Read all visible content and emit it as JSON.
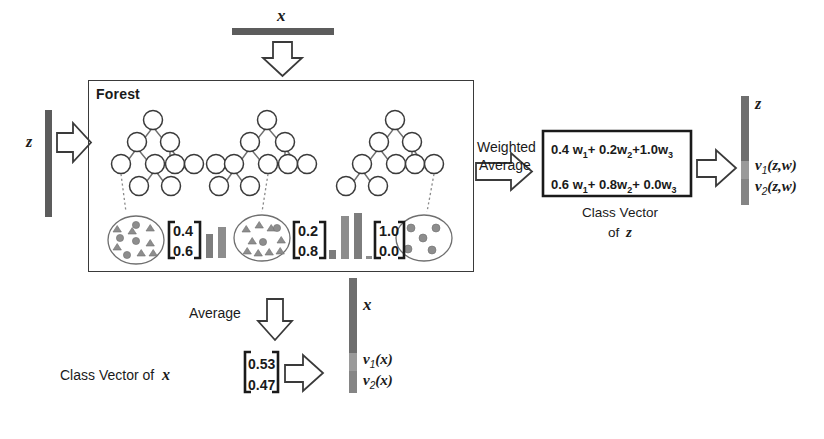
{
  "figure": {
    "forest_box_label": "Forest",
    "input_top_label": "x",
    "input_left_label": "z",
    "weighted_average_label_line1": "Weighted",
    "weighted_average_label_line2": "Average",
    "average_label": "Average",
    "class_vector_of_z_line1": "Class Vector",
    "class_vector_of_z_line2": "of",
    "class_vector_of_z_symbol": "z",
    "class_vector_of_x_label": "Class Vector of",
    "class_vector_of_x_symbol": "x",
    "output_z_bar_label": "z",
    "output_x_bar_label": "x"
  },
  "trees": [
    {
      "id": "tree-1",
      "leaf_sample_shapes": "mixed-circles-and-triangles",
      "class_vector": [
        "0.4",
        "0.6"
      ],
      "bar_heights": [
        0.4,
        0.6
      ]
    },
    {
      "id": "tree-2",
      "leaf_sample_shapes": "mostly-triangles",
      "class_vector": [
        "0.2",
        "0.8"
      ],
      "bar_heights": [
        0.2,
        0.8
      ]
    },
    {
      "id": "tree-3",
      "leaf_sample_shapes": "all-circles",
      "class_vector": [
        "1.0",
        "0.0"
      ],
      "bar_heights": [
        1.0,
        0.0
      ]
    }
  ],
  "weighted_average": {
    "row1": [
      "0.4 w",
      "1",
      "+ 0.2w",
      "2",
      "+1.0w",
      "3"
    ],
    "row2": [
      "0.6 w",
      "1",
      "+ 0.8w",
      "2",
      "+ 0.0w",
      "3"
    ],
    "row1_plain": "0.4 w1+ 0.2w2+1.0w3",
    "row2_plain": "0.6 w1+ 0.8w2+ 0.0w3"
  },
  "outputs": {
    "z_vector": [
      "v1(z,w)",
      "v2(z,w)"
    ],
    "z_v1_base": "v",
    "z_v1_sub": "1",
    "z_v1_args": "(z,w)",
    "z_v2_base": "v",
    "z_v2_sub": "2",
    "z_v2_args": "(z,w)",
    "x_vector": [
      "v1(x)",
      "v2(x)"
    ],
    "x_v1_base": "v",
    "x_v1_sub": "1",
    "x_v1_args": "(x)",
    "x_v2_base": "v",
    "x_v2_sub": "2",
    "x_v2_args": "(x)"
  },
  "average_class_vector_of_x": [
    "0.53",
    "0.47"
  ],
  "colors": {
    "bar_dark": "#5c5c5c",
    "bar_mid": "#7d7d7d",
    "bar_light": "#9a9a9a",
    "outline": "#3a3a3a",
    "text": "#1a1a1a",
    "background": "#ffffff"
  }
}
